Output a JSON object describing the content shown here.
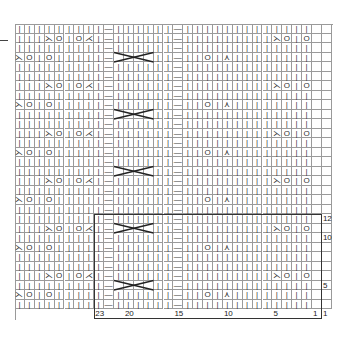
{
  "chart_title": "",
  "grid": {
    "cols": 32,
    "rows": 31,
    "cell_w": 9.9,
    "cell_h": 9.5
  },
  "legend_symbols": {
    "knit": "|",
    "purl": "—",
    "yarn_over": "O",
    "k2tog": "⋌",
    "ssk": "⋋",
    "s2kp": "⋏",
    "cable": "cross"
  },
  "purl_columns": [
    9,
    16
  ],
  "stitch_labels": [
    {
      "n": "23",
      "col": 8
    },
    {
      "n": "20",
      "col": 11
    },
    {
      "n": "15",
      "col": 16
    },
    {
      "n": "10",
      "col": 21
    },
    {
      "n": "5",
      "col": 26
    },
    {
      "n": "1",
      "col": 30
    }
  ],
  "row_labels": [
    {
      "n": "12",
      "row": 20
    },
    {
      "n": "10",
      "row": 22
    },
    {
      "n": "5",
      "row": 27
    },
    {
      "n": "1",
      "row": 30
    }
  ],
  "repeat_box": {
    "col_start": 8,
    "col_end": 31,
    "row_start": 20,
    "row_end": 31
  }
}
